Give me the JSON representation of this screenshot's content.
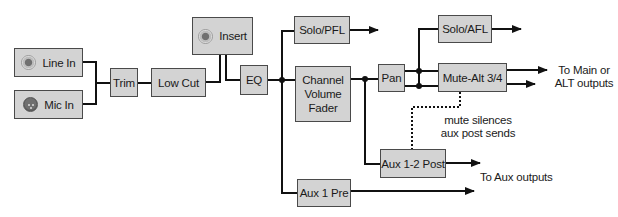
{
  "diagram": {
    "type": "signal-flow",
    "blocks": {
      "line_in": "Line In",
      "mic_in": "Mic In",
      "trim": "Trim",
      "low_cut": "Low Cut",
      "insert": "Insert",
      "eq": "EQ",
      "solo_pfl": "Solo/PFL",
      "channel_fader_1": "Channel",
      "channel_fader_2": "Volume",
      "channel_fader_3": "Fader",
      "pan": "Pan",
      "solo_afl": "Solo/AFL",
      "mute_alt": "Mute-Alt 3/4",
      "aux_post": "Aux 1-2 Post",
      "aux_pre": "Aux 1 Pre"
    },
    "annotations": {
      "main_out_1": "To Main or",
      "main_out_2": "ALT outputs",
      "mute_note_1": "mute silences",
      "mute_note_2": "aux post sends",
      "aux_out": "To Aux outputs"
    },
    "icons": {
      "line_in": "trs-jack-icon",
      "mic_in": "xlr-connector-icon",
      "insert": "trs-jack-icon"
    },
    "colors": {
      "box_fill": "#d3d3d3",
      "box_border": "#4a4a4a",
      "wire": "#111111"
    }
  }
}
